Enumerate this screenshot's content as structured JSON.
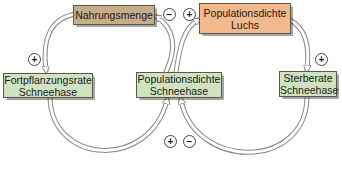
{
  "nodes": {
    "food": {
      "label": "Nahrungsmenge",
      "color": "#c8ad8a"
    },
    "lynx": {
      "line1": "Populationsdichte",
      "line2": "Luchs",
      "color": "#f3b98c"
    },
    "reproduction": {
      "line1": "Fortpflanzungsrate",
      "line2": "Schneehase",
      "color": "#cfe3c0"
    },
    "hare_density": {
      "line1": "Populationsdichte",
      "line2": "Schneehase",
      "color": "#cfe3c0"
    },
    "mortality": {
      "line1": "Sterberate",
      "line2": "Schneehase",
      "color": "#cfe3c0"
    }
  },
  "signs": {
    "food_to_reproduction": "+",
    "hare_to_food": "−",
    "hare_to_lynx": "+",
    "lynx_to_mortality": "+",
    "reproduction_to_hare": "+",
    "mortality_to_hare": "−"
  }
}
